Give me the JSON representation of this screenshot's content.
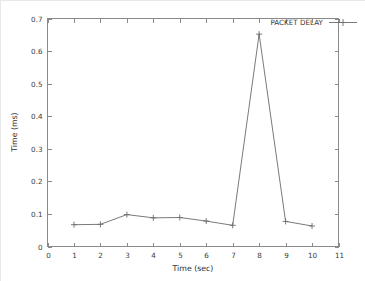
{
  "chart_data": {
    "type": "line",
    "title": "",
    "subtitle": "",
    "xlabel": "Time (sec)",
    "ylabel": "Time (ms)",
    "xlim": [
      0,
      11
    ],
    "ylim": [
      0,
      0.7
    ],
    "xticks": [
      "0",
      "1",
      "2",
      "3",
      "4",
      "5",
      "6",
      "7",
      "8",
      "9",
      "10",
      "11"
    ],
    "yticks": [
      "0",
      "0.1",
      "0.2",
      "0.3",
      "0.4",
      "0.5",
      "0.6",
      "0.7"
    ],
    "grid": false,
    "legend_position": "top-right-inside",
    "marker": "plus",
    "x": [
      1,
      2,
      3,
      4,
      5,
      6,
      7,
      8,
      9,
      10
    ],
    "series": [
      {
        "name": "PACKET DELAY",
        "values": [
          0.067,
          0.068,
          0.098,
          0.088,
          0.089,
          0.078,
          0.065,
          0.652,
          0.077,
          0.063
        ]
      }
    ],
    "annotations": []
  },
  "legend": {
    "entries": [
      {
        "label": "PACKET DELAY"
      }
    ]
  },
  "axes": {
    "x_title": "Time (sec)",
    "y_title": "Time (ms)"
  },
  "colors": {
    "line": "#6b6b6b",
    "frame": "#8a8a8a",
    "text": "#3a3a3a",
    "background": "#ffffff"
  }
}
